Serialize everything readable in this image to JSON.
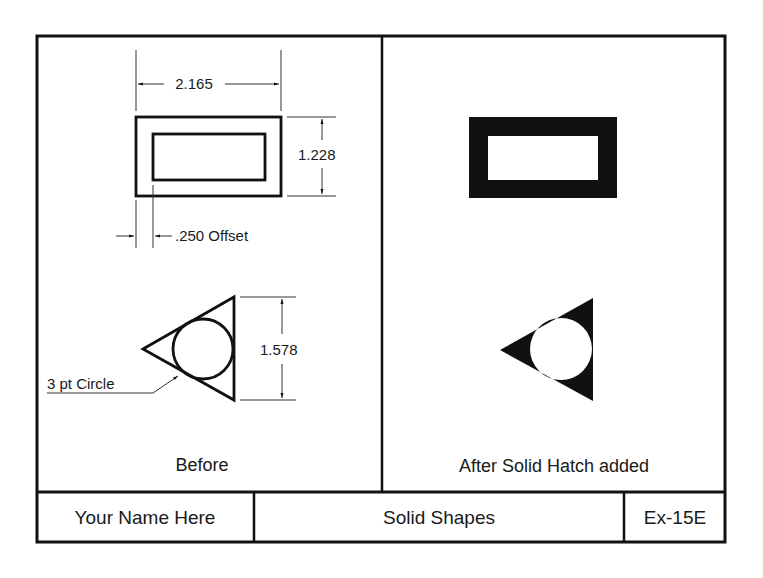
{
  "colors": {
    "ink": "#111111",
    "paper": "#ffffff"
  },
  "panels": {
    "before": {
      "caption": "Before",
      "rectangle": {
        "width_dimension": "2.165",
        "height_dimension": "1.228",
        "offset_dimension": ".250 Offset"
      },
      "triangle": {
        "height_dimension": "1.578",
        "leader_note": "3 pt Circle"
      }
    },
    "after": {
      "caption": "After Solid Hatch added"
    }
  },
  "title_block": {
    "name": "Your Name Here",
    "drawing_title": "Solid Shapes",
    "exercise_number": "Ex-15E"
  }
}
